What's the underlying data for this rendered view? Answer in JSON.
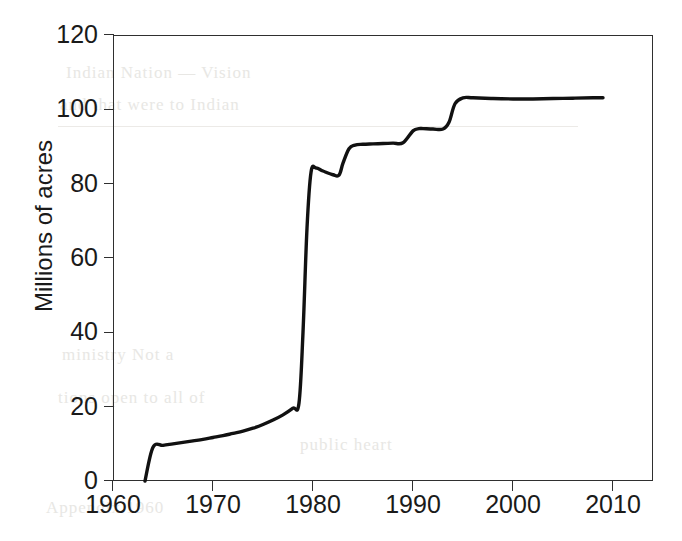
{
  "chart_data": {
    "type": "line",
    "title": "",
    "subtitle": "",
    "xlabel": "",
    "ylabel": "Millions of acres",
    "xlim": [
      1960,
      2014
    ],
    "ylim": [
      0,
      120
    ],
    "grid": false,
    "legend": null,
    "x_ticks": [
      1960,
      1970,
      1980,
      1990,
      2000,
      2010
    ],
    "x_tick_labels": [
      "1960",
      "1970",
      "1980",
      "1990",
      "2000",
      "2010"
    ],
    "y_ticks": [
      0,
      20,
      40,
      60,
      80,
      100,
      120
    ],
    "y_tick_labels": [
      "0",
      "20",
      "40",
      "60",
      "80",
      "100",
      "120"
    ],
    "series": [
      {
        "name": "Cumulative designated acreage",
        "color": "#111111",
        "line_width": 3.4,
        "x": [
          1963.2,
          1964.0,
          1965.0,
          1966.0,
          1967.0,
          1968.0,
          1969.0,
          1970.0,
          1971.0,
          1972.0,
          1973.0,
          1974.0,
          1975.0,
          1976.0,
          1977.0,
          1978.0,
          1978.6,
          1979.0,
          1979.4,
          1979.8,
          1980.3,
          1981.0,
          1982.0,
          1982.6,
          1983.0,
          1983.6,
          1984.2,
          1985.0,
          1986.0,
          1987.0,
          1988.0,
          1989.0,
          1990.0,
          1990.6,
          1991.0,
          1992.0,
          1993.0,
          1993.6,
          1994.2,
          1995.0,
          1996.0,
          1998.0,
          2000.0,
          2002.0,
          2004.0,
          2006.0,
          2008.0,
          2009.0
        ],
        "y": [
          0.0,
          9.1,
          9.6,
          10.0,
          10.4,
          10.8,
          11.2,
          11.7,
          12.2,
          12.8,
          13.4,
          14.2,
          15.2,
          16.4,
          17.8,
          19.6,
          21.0,
          40.0,
          68.0,
          83.0,
          84.2,
          83.4,
          82.4,
          82.3,
          85.5,
          89.4,
          90.4,
          90.6,
          90.7,
          90.8,
          90.9,
          91.0,
          94.2,
          94.8,
          94.8,
          94.7,
          94.7,
          96.5,
          101.5,
          103.1,
          103.1,
          102.9,
          102.8,
          102.8,
          102.9,
          103.0,
          103.1,
          103.1
        ]
      }
    ]
  },
  "axis": {
    "y_title": "Millions of acres"
  },
  "background_bleed": {
    "line1": "Indian Nation — Vision",
    "line2": "and that were to Indian",
    "line3": "ministry    Not a",
    "line4": "tions open to    all of",
    "line5": "public heart",
    "line6": "Appendix 1960"
  }
}
